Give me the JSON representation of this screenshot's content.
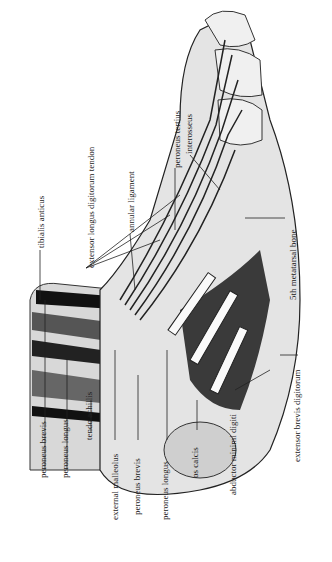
{
  "figure": {
    "orientation": "rotated 90 degrees counter-clockwise",
    "labels": [
      {
        "id": "peroneus-brevis-top",
        "text": "peroneus brevis",
        "x": 45,
        "y": 478
      },
      {
        "id": "peroneus-longus-top",
        "text": "peroneus longus",
        "x": 67,
        "y": 478
      },
      {
        "id": "tendo-achillis",
        "text": "tendo achillis",
        "x": 91,
        "y": 440
      },
      {
        "id": "external-malleolus",
        "text": "external malleolus",
        "x": 118,
        "y": 510
      },
      {
        "id": "peroneus-brevis-bottom",
        "text": "peroneus brevis",
        "x": 141,
        "y": 505
      },
      {
        "id": "peroneus-longus-bottom",
        "text": "peroneus longus",
        "x": 170,
        "y": 510
      },
      {
        "id": "os-calcis",
        "text": "os calcis",
        "x": 200,
        "y": 480
      },
      {
        "id": "abductor-minimi-digiti",
        "text": "abductor minimi digiti",
        "x": 236,
        "y": 460
      },
      {
        "id": "extensor-brevis-digitorum",
        "text": "extensor brevis digitorum",
        "x": 302,
        "y": 400
      },
      {
        "id": "5th-metatarsal-bone",
        "text": "5th metatarsal bone",
        "x": 297,
        "y": 290
      },
      {
        "id": "tibialis-anticus",
        "text": "tibialis anticus",
        "x": 44,
        "y": 250
      },
      {
        "id": "extensor-longus-digitorum-tendon",
        "text": "extensor longus digitorum tendon",
        "x": 93,
        "y": 268
      },
      {
        "id": "annular-ligament",
        "text": "annular ligament",
        "x": 134,
        "y": 230
      },
      {
        "id": "peroneus-tertius",
        "text": "peroneus tertius",
        "x": 180,
        "y": 160
      },
      {
        "id": "interosseus",
        "text": "interosseus",
        "x": 192,
        "y": 152
      }
    ]
  }
}
